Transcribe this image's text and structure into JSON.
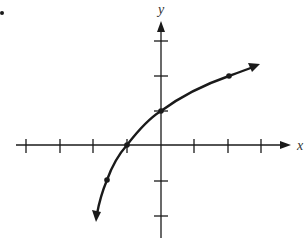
{
  "figure": {
    "bullet": "•",
    "axes": {
      "x_label": "x",
      "y_label": "y",
      "x_ticks": [
        -4,
        -3,
        -2,
        -1,
        1,
        2,
        3
      ],
      "y_ticks": [
        -2,
        -1,
        1,
        2,
        3
      ]
    },
    "curve": {
      "description": "Increasing logarithmic curve with arrows at both ends, passing through marked points",
      "marked_points": [
        {
          "x": -1.5,
          "y": -1
        },
        {
          "x": -1,
          "y": 0
        },
        {
          "x": 0,
          "y": 1
        },
        {
          "x": 2,
          "y": 2
        }
      ]
    },
    "colors": {
      "ink": "#1a1a1a",
      "background": "#ffffff"
    }
  }
}
